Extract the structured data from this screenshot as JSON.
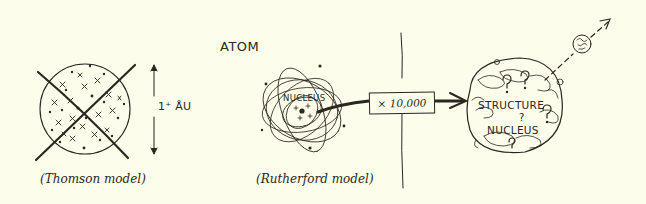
{
  "diagram": {
    "title": "ATOM",
    "colors": {
      "background": "#fdfdec",
      "ink": "#2a2620"
    },
    "thomson": {
      "caption": "(Thomson model)",
      "size_label": "1⁺ ÅU",
      "crossed_out": true
    },
    "rutherford": {
      "caption": "(Rutherford model)",
      "nucleus_label": "NUCLEUS"
    },
    "magnification": {
      "label": "× 10,000"
    },
    "nucleus_structure": {
      "line1": "STRUCTURE",
      "line2": "?",
      "line3": "NUCLEUS"
    },
    "emitted_particle": {
      "symbol": "circled-particle",
      "direction": "up-right dashed arrow"
    }
  }
}
